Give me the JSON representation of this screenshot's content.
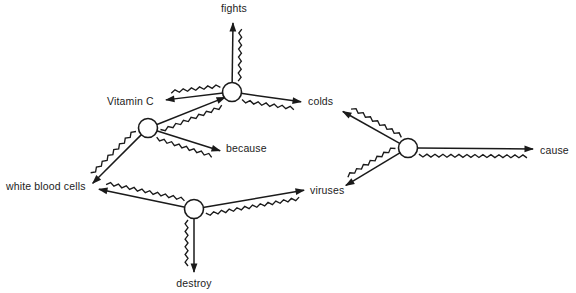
{
  "diagram": {
    "type": "semantic-network",
    "width": 576,
    "height": 293,
    "background_color": "#ffffff",
    "ink_color": "#1a1a1a",
    "text_color": "#222222",
    "terminals": [
      {
        "id": "fights",
        "label": "fights",
        "x": 234,
        "y": 12,
        "anchor": "middle"
      },
      {
        "id": "vitamin-c",
        "label": "Vitamin C",
        "x": 107,
        "y": 105,
        "anchor": "start"
      },
      {
        "id": "colds",
        "label": "colds",
        "x": 308,
        "y": 105,
        "anchor": "start"
      },
      {
        "id": "because",
        "label": "because",
        "x": 226,
        "y": 152,
        "anchor": "start"
      },
      {
        "id": "white-blood-cells",
        "label": "white blood cells",
        "x": 6,
        "y": 190,
        "anchor": "start"
      },
      {
        "id": "viruses",
        "label": "viruses",
        "x": 310,
        "y": 194,
        "anchor": "start"
      },
      {
        "id": "cause",
        "label": "cause",
        "x": 540,
        "y": 154,
        "anchor": "start"
      },
      {
        "id": "destroy",
        "label": "destroy",
        "x": 194,
        "y": 287,
        "anchor": "middle"
      }
    ],
    "junctions": [
      {
        "id": "node-top",
        "x": 232,
        "y": 92,
        "r": 9.5
      },
      {
        "id": "node-left",
        "x": 148,
        "y": 128,
        "r": 9.5
      },
      {
        "id": "node-bottom",
        "x": 194,
        "y": 209,
        "r": 9.5
      },
      {
        "id": "node-right",
        "x": 408,
        "y": 148,
        "r": 9.5
      }
    ],
    "edges": [
      {
        "id": "edge-top-fights",
        "from": "node-top",
        "to": "fights",
        "x1": 232,
        "y1": 92,
        "x2": 233,
        "y2": 22,
        "arrow": "end",
        "squiggle_side": "left"
      },
      {
        "id": "edge-top-vitaminc",
        "from": "node-top",
        "to": "vitamin-c",
        "x1": 232,
        "y1": 92,
        "x2": 165,
        "y2": 100,
        "arrow": "end",
        "squiggle_side": "left"
      },
      {
        "id": "edge-top-colds",
        "from": "node-top",
        "to": "colds",
        "x1": 232,
        "y1": 92,
        "x2": 302,
        "y2": 102,
        "arrow": "end",
        "squiggle_side": "left"
      },
      {
        "id": "edge-left-top",
        "from": "node-left",
        "to": "node-top",
        "x1": 148,
        "y1": 128,
        "x2": 226,
        "y2": 97,
        "arrow": "end",
        "squiggle_side": "left"
      },
      {
        "id": "edge-left-because",
        "from": "node-left",
        "to": "because",
        "x1": 148,
        "y1": 128,
        "x2": 221,
        "y2": 151,
        "arrow": "end",
        "squiggle_side": "left"
      },
      {
        "id": "edge-left-wbc",
        "from": "node-left",
        "to": "white-blood-cells",
        "x1": 148,
        "y1": 128,
        "x2": 92,
        "y2": 184,
        "arrow": "end",
        "squiggle_side": "left"
      },
      {
        "id": "edge-bottom-wbc",
        "from": "node-bottom",
        "to": "white-blood-cells",
        "x1": 194,
        "y1": 209,
        "x2": 98,
        "y2": 189,
        "arrow": "end",
        "squiggle_side": "left"
      },
      {
        "id": "edge-bottom-viruses",
        "from": "node-bottom",
        "to": "viruses",
        "x1": 194,
        "y1": 209,
        "x2": 305,
        "y2": 190,
        "arrow": "end",
        "squiggle_side": "left"
      },
      {
        "id": "edge-bottom-destroy",
        "from": "node-bottom",
        "to": "destroy",
        "x1": 194,
        "y1": 209,
        "x2": 194,
        "y2": 273,
        "arrow": "end",
        "squiggle_side": "left"
      },
      {
        "id": "edge-right-colds",
        "from": "node-right",
        "to": "colds",
        "x1": 408,
        "y1": 148,
        "x2": 342,
        "y2": 111,
        "arrow": "end",
        "squiggle_side": "left"
      },
      {
        "id": "edge-right-viruses",
        "from": "node-right",
        "to": "viruses",
        "x1": 408,
        "y1": 148,
        "x2": 345,
        "y2": 186,
        "arrow": "end",
        "squiggle_side": "left"
      },
      {
        "id": "edge-right-cause",
        "from": "node-right",
        "to": "cause",
        "x1": 408,
        "y1": 148,
        "x2": 534,
        "y2": 149,
        "arrow": "end",
        "squiggle_side": "left"
      }
    ],
    "relations": [
      {
        "subject": "Vitamin C",
        "relation": "fights",
        "object": "colds"
      },
      {
        "subject": "white blood cells",
        "relation": "because",
        "object": "Vitamin C"
      },
      {
        "subject": "white blood cells",
        "relation": "destroy",
        "object": "viruses"
      },
      {
        "subject": "viruses",
        "relation": "cause",
        "object": "colds"
      }
    ]
  }
}
